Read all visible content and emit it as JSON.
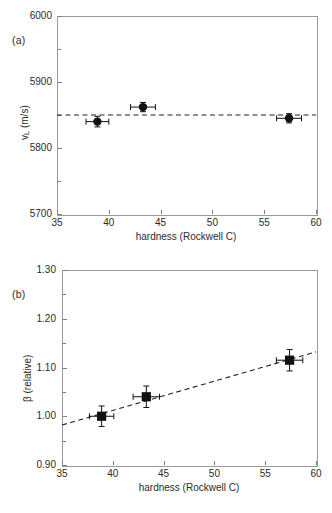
{
  "figure": {
    "panels": [
      {
        "id": "a",
        "label": "(a)",
        "xlabel": "hardness (Rockwell C)",
        "ylabel_main": "v",
        "ylabel_sub": "L",
        "ylabel_tail": " (m/s)",
        "ylabel_full": "v_L (m/s)",
        "xticks": [
          "35",
          "40",
          "45",
          "50",
          "55",
          "60"
        ],
        "yticks": [
          "5700",
          "5800",
          "5900",
          "6000"
        ]
      },
      {
        "id": "b",
        "label": "(b)",
        "xlabel": "hardness (Rockwell C)",
        "ylabel_full": "β (relative)",
        "xticks": [
          "35",
          "40",
          "45",
          "50",
          "55",
          "60"
        ],
        "yticks": [
          "0.90",
          "1.00",
          "1.10",
          "1.20",
          "1.30"
        ]
      }
    ]
  },
  "chart_data": [
    {
      "type": "scatter",
      "panel": "a",
      "title": "(a)",
      "xlabel": "hardness (Rockwell C)",
      "ylabel": "v_L (m/s)",
      "xlim": [
        35,
        60
      ],
      "ylim": [
        5700,
        6000
      ],
      "xticks": [
        35,
        40,
        45,
        50,
        55,
        60
      ],
      "yticks": [
        5700,
        5800,
        5900,
        6000
      ],
      "grid": false,
      "legend": "none",
      "marker": "filled-circle",
      "series": [
        {
          "name": "longitudinal wave speed",
          "x": [
            38.9,
            43.3,
            57.4
          ],
          "y": [
            5840,
            5862,
            5845
          ],
          "xerr": [
            1.1,
            1.2,
            1.2
          ],
          "yerr": [
            8,
            7,
            7
          ]
        }
      ],
      "fit": {
        "style": "dashed",
        "type": "constant",
        "value": 5850,
        "x_range": [
          35,
          60
        ]
      }
    },
    {
      "type": "scatter",
      "panel": "b",
      "title": "(b)",
      "xlabel": "hardness (Rockwell C)",
      "ylabel": "β (relative)",
      "xlim": [
        35,
        60
      ],
      "ylim": [
        0.9,
        1.3
      ],
      "xticks": [
        35,
        40,
        45,
        50,
        55,
        60
      ],
      "yticks": [
        0.9,
        1.0,
        1.1,
        1.2,
        1.3
      ],
      "grid": false,
      "legend": "none",
      "marker": "filled-square",
      "series": [
        {
          "name": "nonlinearity parameter beta",
          "x": [
            38.9,
            43.3,
            57.4
          ],
          "y": [
            1.0,
            1.04,
            1.115
          ],
          "xerr": [
            1.2,
            1.3,
            1.3
          ],
          "yerr": [
            0.021,
            0.022,
            0.022
          ]
        }
      ],
      "fit": {
        "style": "dashed",
        "type": "linear",
        "x_range": [
          35,
          60
        ],
        "y_range": [
          0.982,
          1.132
        ]
      }
    }
  ],
  "colors": {
    "axis": "#9a9a9a",
    "tick": "#7d7d7d",
    "text": "#2b2b2b",
    "marker": "#111111",
    "fit": "#222222",
    "background": "#ffffff"
  }
}
